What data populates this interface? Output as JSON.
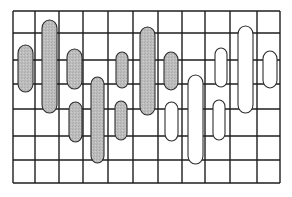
{
  "diagram": {
    "type": "grid-with-rounded-blobs",
    "colors": {
      "background": "#ffffff",
      "grid_line": "#1e1e1e",
      "blob_outline": "#2e2e2e",
      "blob_gray_fill": "#bcbcbc",
      "blob_white_fill": "#ffffff"
    },
    "grid": {
      "left": 13,
      "top": 11,
      "right": 280,
      "bottom": 183,
      "vertical_lines": [
        13,
        35,
        59,
        83,
        108,
        133,
        158,
        182,
        205,
        230,
        257,
        280
      ],
      "horizontal_lines": [
        11,
        33,
        60,
        84,
        109,
        136,
        160,
        183
      ]
    },
    "blobs": [
      {
        "id": 1,
        "fill": "gray",
        "x": 18,
        "y": 45,
        "w": 15,
        "h": 47
      },
      {
        "id": 2,
        "fill": "gray",
        "x": 42,
        "y": 20,
        "w": 15,
        "h": 93
      },
      {
        "id": 3,
        "fill": "gray",
        "x": 67,
        "y": 49,
        "w": 15,
        "h": 40
      },
      {
        "id": 4,
        "fill": "gray",
        "x": 69,
        "y": 102,
        "w": 13,
        "h": 40
      },
      {
        "id": 5,
        "fill": "gray",
        "x": 91,
        "y": 77,
        "w": 13,
        "h": 86
      },
      {
        "id": 6,
        "fill": "gray",
        "x": 115,
        "y": 101,
        "w": 12,
        "h": 39
      },
      {
        "id": 7,
        "fill": "gray",
        "x": 116,
        "y": 52,
        "w": 12,
        "h": 36
      },
      {
        "id": 8,
        "fill": "gray",
        "x": 140,
        "y": 27,
        "w": 15,
        "h": 88
      },
      {
        "id": 9,
        "fill": "gray",
        "x": 164,
        "y": 52,
        "w": 14,
        "h": 38
      },
      {
        "id": 10,
        "fill": "white",
        "x": 165,
        "y": 102,
        "w": 13,
        "h": 39
      },
      {
        "id": 11,
        "fill": "white",
        "x": 188,
        "y": 75,
        "w": 15,
        "h": 89
      },
      {
        "id": 12,
        "fill": "white",
        "x": 213,
        "y": 100,
        "w": 12,
        "h": 40
      },
      {
        "id": 13,
        "fill": "white",
        "x": 215,
        "y": 48,
        "w": 12,
        "h": 39
      },
      {
        "id": 14,
        "fill": "white",
        "x": 238,
        "y": 26,
        "w": 15,
        "h": 87
      },
      {
        "id": 15,
        "fill": "white",
        "x": 263,
        "y": 51,
        "w": 14,
        "h": 37
      }
    ]
  }
}
